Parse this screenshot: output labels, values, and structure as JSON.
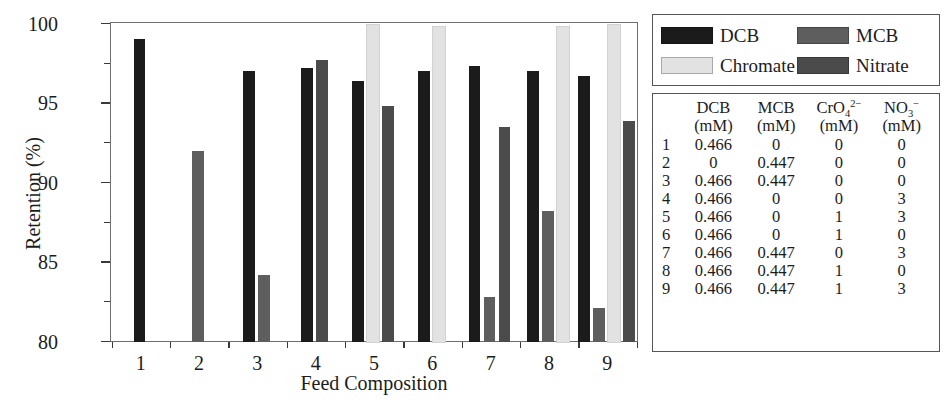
{
  "chart_data": {
    "type": "bar",
    "title": "",
    "xlabel": "Feed Composition",
    "ylabel": "Retention (%)",
    "ylim": [
      80,
      100
    ],
    "ytick_major": [
      80,
      85,
      90,
      95,
      100
    ],
    "ytick_minor": [
      82.5,
      87.5,
      92.5,
      97.5
    ],
    "grid": false,
    "legend_position": "right-top",
    "categories": [
      "1",
      "2",
      "3",
      "4",
      "5",
      "6",
      "7",
      "8",
      "9"
    ],
    "series": [
      {
        "name": "DCB",
        "color": "#1b1b1b",
        "values": [
          99.0,
          null,
          97.0,
          97.2,
          96.4,
          97.0,
          97.3,
          97.0,
          96.7
        ]
      },
      {
        "name": "MCB",
        "color": "#5e5e5e",
        "values": [
          null,
          92.0,
          84.2,
          null,
          null,
          null,
          82.8,
          88.2,
          82.1
        ]
      },
      {
        "name": "Chromate",
        "color": "#e2e2e2",
        "values": [
          null,
          null,
          null,
          null,
          99.9,
          99.8,
          null,
          99.8,
          99.9
        ]
      },
      {
        "name": "Nitrate",
        "color": "#4b4b4b",
        "values": [
          null,
          null,
          null,
          97.7,
          94.8,
          null,
          93.5,
          null,
          93.9
        ]
      }
    ]
  },
  "legend": {
    "entries": [
      {
        "label": "DCB",
        "color": "#1b1b1b"
      },
      {
        "label": "MCB",
        "color": "#5e5e5e"
      },
      {
        "label": "Chromate",
        "color": "#e2e2e2"
      },
      {
        "label": "Nitrate",
        "color": "#4b4b4b"
      }
    ]
  },
  "table": {
    "index_header": "",
    "columns": [
      {
        "name": "DCB",
        "unit": "(mM)"
      },
      {
        "name": "MCB",
        "unit": "(mM)"
      },
      {
        "name": "CrO4",
        "charge": "2−",
        "sub": "4",
        "unit": "(mM)"
      },
      {
        "name": "NO3",
        "charge": "−",
        "sub": "3",
        "unit": "(mM)"
      }
    ],
    "rows": [
      {
        "idx": "1",
        "dcb": "0.466",
        "mcb": "0",
        "cro4": "0",
        "no3": "0"
      },
      {
        "idx": "2",
        "dcb": "0",
        "mcb": "0.447",
        "cro4": "0",
        "no3": "0"
      },
      {
        "idx": "3",
        "dcb": "0.466",
        "mcb": "0.447",
        "cro4": "0",
        "no3": "0"
      },
      {
        "idx": "4",
        "dcb": "0.466",
        "mcb": "0",
        "cro4": "0",
        "no3": "3"
      },
      {
        "idx": "5",
        "dcb": "0.466",
        "mcb": "0",
        "cro4": "1",
        "no3": "3"
      },
      {
        "idx": "6",
        "dcb": "0.466",
        "mcb": "0",
        "cro4": "1",
        "no3": "0"
      },
      {
        "idx": "7",
        "dcb": "0.466",
        "mcb": "0.447",
        "cro4": "0",
        "no3": "3"
      },
      {
        "idx": "8",
        "dcb": "0.466",
        "mcb": "0.447",
        "cro4": "1",
        "no3": "0"
      },
      {
        "idx": "9",
        "dcb": "0.466",
        "mcb": "0.447",
        "cro4": "1",
        "no3": "3"
      }
    ]
  }
}
